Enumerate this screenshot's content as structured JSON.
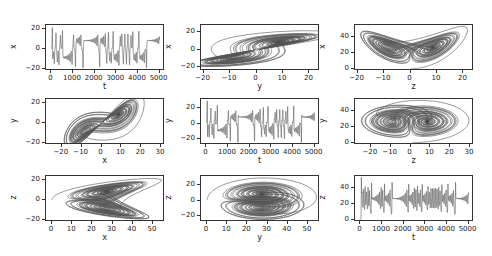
{
  "figure": {
    "title": "",
    "line_color": "#555555",
    "grid": false
  },
  "chart_data": [
    {
      "id": "p1",
      "type": "line",
      "title": "",
      "xlabel": "t",
      "ylabel": "x",
      "xlim": [
        -250,
        5250
      ],
      "ylim": [
        -22,
        24
      ],
      "xticks": [
        0,
        1000,
        2000,
        3000,
        4000,
        5000
      ],
      "xtick_labels": [
        "0",
        "1000",
        "2000",
        "3000",
        "4000",
        "5000"
      ],
      "yticks": [
        -20,
        0,
        20
      ],
      "ytick_labels": [
        "-20",
        "0",
        "20"
      ],
      "description": "Lorenz x(t) time series, oscillating between about -20 and 22"
    },
    {
      "id": "p2",
      "type": "line",
      "title": "",
      "xlabel": "y",
      "ylabel": "x",
      "xlim": [
        -21,
        24
      ],
      "ylim": [
        -24,
        28
      ],
      "xticks": [
        -20,
        -10,
        0,
        10,
        20
      ],
      "xtick_labels": [
        "-20",
        "-10",
        "0",
        "10",
        "20"
      ],
      "yticks": [
        -20,
        0,
        20
      ],
      "ytick_labels": [
        "-20",
        "0",
        "20"
      ],
      "description": "Phase portrait x vs y (butterfly)"
    },
    {
      "id": "p3",
      "type": "line",
      "title": "",
      "xlabel": "z",
      "ylabel": "x",
      "xlim": [
        -21,
        24
      ],
      "ylim": [
        -3,
        56
      ],
      "xticks": [
        -20,
        -10,
        0,
        10,
        20
      ],
      "xtick_labels": [
        "-20",
        "-10",
        "0",
        "10",
        "20"
      ],
      "yticks": [
        0,
        20,
        40
      ],
      "ytick_labels": [
        "0",
        "20",
        "40"
      ],
      "description": "Phase portrait (butterfly wings)"
    },
    {
      "id": "p4",
      "type": "line",
      "title": "",
      "xlabel": "x",
      "ylabel": "y",
      "xlim": [
        -28,
        32
      ],
      "ylim": [
        -22,
        24
      ],
      "xticks": [
        -20,
        -10,
        0,
        10,
        20,
        30
      ],
      "xtick_labels": [
        "-20",
        "-10",
        "0",
        "10",
        "20",
        "30"
      ],
      "yticks": [
        -20,
        0,
        20
      ],
      "ytick_labels": [
        "-20",
        "0",
        "20"
      ],
      "description": "Phase portrait y vs x"
    },
    {
      "id": "p5",
      "type": "line",
      "title": "",
      "xlabel": "t",
      "ylabel": "y",
      "xlim": [
        -250,
        5250
      ],
      "ylim": [
        -28,
        32
      ],
      "xticks": [
        0,
        1000,
        2000,
        3000,
        4000,
        5000
      ],
      "xtick_labels": [
        "0",
        "1000",
        "2000",
        "3000",
        "4000",
        "5000"
      ],
      "yticks": [
        -20,
        0,
        20
      ],
      "ytick_labels": [
        "-20",
        "0",
        "20"
      ],
      "description": "Lorenz y(t) time series"
    },
    {
      "id": "p6",
      "type": "line",
      "title": "",
      "xlabel": "z",
      "ylabel": "y",
      "xlim": [
        -28,
        32
      ],
      "ylim": [
        -3,
        56
      ],
      "xticks": [
        -20,
        -10,
        0,
        10,
        20,
        30
      ],
      "xtick_labels": [
        "-20",
        "-10",
        "0",
        "10",
        "20",
        "30"
      ],
      "yticks": [
        0,
        20,
        40
      ],
      "ytick_labels": [
        "0",
        "20",
        "40"
      ],
      "description": "Phase portrait (two lobes)"
    },
    {
      "id": "p7",
      "type": "line",
      "title": "",
      "xlabel": "x",
      "ylabel": "z",
      "xlim": [
        -3,
        56
      ],
      "ylim": [
        -22,
        24
      ],
      "xticks": [
        0,
        10,
        20,
        30,
        40,
        50
      ],
      "xtick_labels": [
        "0",
        "10",
        "20",
        "30",
        "40",
        "50"
      ],
      "yticks": [
        -20,
        0,
        20
      ],
      "ytick_labels": [
        "-20",
        "0",
        "20"
      ],
      "description": "Phase portrait z vs x"
    },
    {
      "id": "p8",
      "type": "line",
      "title": "",
      "xlabel": "y",
      "ylabel": "z",
      "xlim": [
        -3,
        56
      ],
      "ylim": [
        -28,
        32
      ],
      "xticks": [
        0,
        10,
        20,
        30,
        40,
        50
      ],
      "xtick_labels": [
        "0",
        "10",
        "20",
        "30",
        "40",
        "50"
      ],
      "yticks": [
        -20,
        0,
        20
      ],
      "ytick_labels": [
        "-20",
        "0",
        "20"
      ],
      "description": "Phase portrait z vs y"
    },
    {
      "id": "p9",
      "type": "line",
      "title": "",
      "xlabel": "t",
      "ylabel": "z",
      "xlim": [
        -250,
        5250
      ],
      "ylim": [
        -3,
        56
      ],
      "xticks": [
        0,
        1000,
        2000,
        3000,
        4000,
        5000
      ],
      "xtick_labels": [
        "0",
        "1000",
        "2000",
        "3000",
        "4000",
        "5000"
      ],
      "yticks": [
        0,
        20,
        40
      ],
      "ytick_labels": [
        "0",
        "20",
        "40"
      ],
      "description": "Lorenz z(t) time series, oscillating between about 5 and 50"
    }
  ]
}
